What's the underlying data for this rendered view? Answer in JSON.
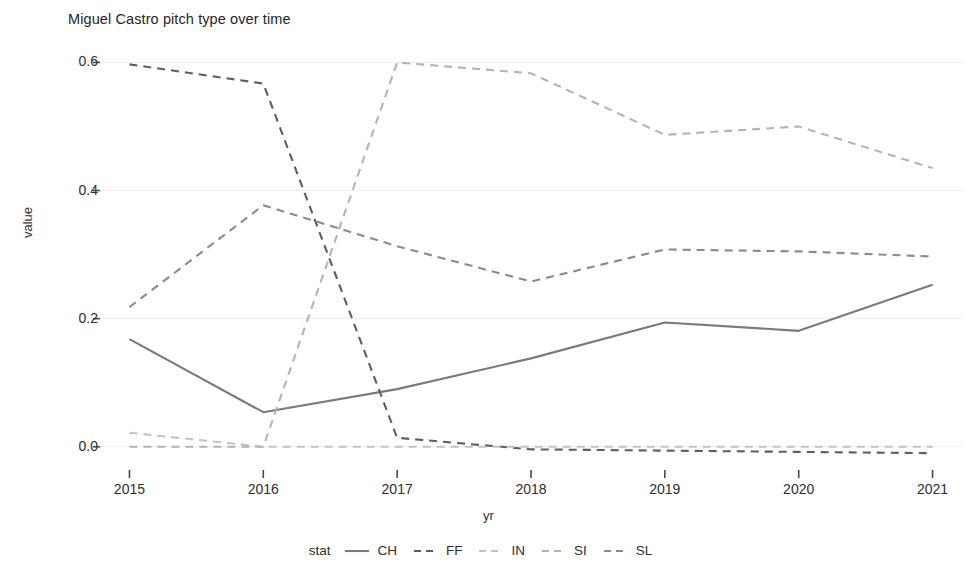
{
  "chart_data": {
    "type": "line",
    "title": "Miguel Castro pitch type over time",
    "xlabel": "yr",
    "ylabel": "value",
    "x": [
      2015,
      2016,
      2017,
      2018,
      2019,
      2020,
      2021
    ],
    "categories": [
      "2015",
      "2016",
      "2017",
      "2018",
      "2019",
      "2020",
      "2021"
    ],
    "xtick_labels": [
      "2015",
      "2016",
      "2017",
      "2018",
      "2019",
      "2020",
      "2021"
    ],
    "ytick_labels": [
      "0.0",
      "0.2",
      "0.4",
      "0.6"
    ],
    "ytick_values": [
      0.0,
      0.2,
      0.4,
      0.6
    ],
    "ylim": [
      -0.03,
      0.635
    ],
    "xlim": [
      2014.78,
      2021.22
    ],
    "grid": true,
    "legend_title": "stat",
    "legend_position": "bottom",
    "series": [
      {
        "name": "CH",
        "linestyle": "solid",
        "color": "#7a7a7a",
        "values": [
          0.168,
          0.054,
          0.09,
          0.138,
          0.194,
          0.181,
          0.253
        ]
      },
      {
        "name": "FF",
        "linestyle": "dashed",
        "color": "#5e5e5e",
        "values": [
          0.597,
          0.567,
          0.014,
          -0.004,
          -0.006,
          -0.008,
          -0.01
        ]
      },
      {
        "name": "IN",
        "linestyle": "dashed",
        "color": "#c2c2c2",
        "values": [
          0.022,
          0.0,
          0.0,
          0.0,
          0.0,
          0.0,
          0.0
        ]
      },
      {
        "name": "SI",
        "linestyle": "dashed",
        "color": "#b4b4b4",
        "values": [
          0.0,
          0.0,
          0.6,
          0.583,
          0.487,
          0.5,
          0.435
        ]
      },
      {
        "name": "SL",
        "linestyle": "dashed",
        "color": "#8a8a8a",
        "values": [
          0.218,
          0.377,
          0.313,
          0.258,
          0.308,
          0.305,
          0.297
        ]
      }
    ]
  },
  "legend": {
    "title": "stat",
    "entries": [
      {
        "label": "CH",
        "style": "solid"
      },
      {
        "label": "FF",
        "style": "dashed"
      },
      {
        "label": "IN",
        "style": "dashed"
      },
      {
        "label": "SI",
        "style": "dashed"
      },
      {
        "label": "SL",
        "style": "dashed"
      }
    ]
  },
  "colors": {
    "background": "#ffffff",
    "grid": "#ededed",
    "text": "#2e2e2e"
  }
}
